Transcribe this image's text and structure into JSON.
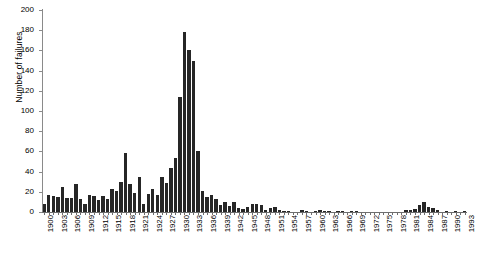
{
  "chart_data": {
    "type": "bar",
    "title": "",
    "xlabel": "",
    "ylabel": "Number of failures",
    "ylim": [
      0,
      200
    ],
    "ytick_step": 20,
    "yticks": [
      0,
      20,
      40,
      60,
      80,
      100,
      120,
      140,
      160,
      180,
      200
    ],
    "xtick_step": 3,
    "xticks": [
      "1900",
      "1903",
      "1906",
      "1909",
      "1912",
      "1915",
      "1918",
      "1921",
      "1924",
      "1927",
      "1930",
      "1933",
      "1936",
      "1939",
      "1942",
      "1945",
      "1948",
      "1951",
      "1954",
      "1957",
      "1960",
      "1963",
      "1966",
      "1969",
      "1972",
      "1975",
      "1978",
      "1981",
      "1984",
      "1987",
      "1990",
      "1993"
    ],
    "grid": false,
    "legend": false,
    "bar_color": "#262626",
    "axis_color": "#7a7a7a",
    "categories": [
      1900,
      1901,
      1902,
      1903,
      1904,
      1905,
      1906,
      1907,
      1908,
      1909,
      1910,
      1911,
      1912,
      1913,
      1914,
      1915,
      1916,
      1917,
      1918,
      1919,
      1920,
      1921,
      1922,
      1923,
      1924,
      1925,
      1926,
      1927,
      1928,
      1929,
      1930,
      1931,
      1932,
      1933,
      1934,
      1935,
      1936,
      1937,
      1938,
      1939,
      1940,
      1941,
      1942,
      1943,
      1944,
      1945,
      1946,
      1947,
      1948,
      1949,
      1950,
      1951,
      1952,
      1953,
      1954,
      1955,
      1956,
      1957,
      1958,
      1959,
      1960,
      1961,
      1962,
      1963,
      1964,
      1965,
      1966,
      1967,
      1968,
      1969,
      1970,
      1971,
      1972,
      1973,
      1974,
      1975,
      1976,
      1977,
      1978,
      1979,
      1980,
      1981,
      1982,
      1983,
      1984,
      1985,
      1986,
      1987,
      1988,
      1989,
      1990,
      1991,
      1992,
      1993
    ],
    "values": [
      8,
      17,
      16,
      15,
      25,
      14,
      14,
      28,
      13,
      8,
      17,
      16,
      12,
      16,
      13,
      23,
      21,
      30,
      58,
      28,
      19,
      35,
      8,
      18,
      23,
      17,
      35,
      29,
      44,
      53,
      114,
      178,
      160,
      150,
      60,
      21,
      15,
      17,
      13,
      7,
      10,
      6,
      10,
      4,
      3,
      5,
      8,
      8,
      7,
      2,
      4,
      5,
      2,
      1,
      1,
      0,
      0,
      2,
      1,
      0,
      1,
      2,
      1,
      1,
      0,
      1,
      1,
      0,
      1,
      1,
      0,
      0,
      0,
      0,
      0,
      0,
      0,
      0,
      0,
      0,
      2,
      2,
      3,
      7,
      10,
      5,
      4,
      2,
      0,
      1,
      0,
      1,
      0,
      1
    ]
  }
}
